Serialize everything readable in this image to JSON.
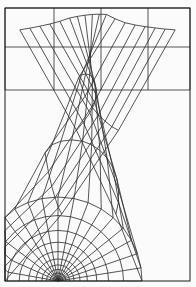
{
  "figure": {
    "type": "mesh-diagram",
    "width": 196,
    "height": 287,
    "background_color": "#fbfbfb",
    "line_color": "#2b2b2b",
    "frame_color": "#1a1a1a",
    "line_width": 0.8,
    "frame_width": 1.0
  },
  "mesh_data": {
    "domain_rect": {
      "x0": 5,
      "y0": 8,
      "x1": 190,
      "y1": 281
    },
    "singularity_point": {
      "x": 58,
      "y": 281
    },
    "description": "Rectangular domain meshed with a polar fan of quadrilaterals that converge geometrically onto a singular point on the bottom edge, blending upward into a structured 4x2 quadrilateral grid.",
    "structured_region": {
      "rows": 2,
      "columns": 4,
      "vertical_lines_x": [
        5,
        54,
        101,
        148,
        190
      ],
      "horizontal_lines_y": [
        8,
        47,
        90
      ]
    },
    "radial_region": {
      "ring_count": 14,
      "ray_count": 17,
      "ring_radii": [
        3.0,
        5.2,
        8.0,
        11.6,
        16.2,
        22.0,
        29.4,
        38.8,
        50.6,
        65.5,
        84.0,
        107.0,
        146.0,
        196.0
      ],
      "ray_angles_deg": [
        0,
        9,
        19,
        29,
        39,
        49,
        59,
        69,
        79,
        90,
        101,
        111,
        121,
        131,
        143,
        156,
        170,
        180
      ],
      "growth_ratio": 1.28,
      "blend_start_ring": 11,
      "note": "Rings are concentric circular arcs about the singular point; radii grow geometrically outward. Rays are straight spokes clipped to the rectangular boundary."
    },
    "legend": [],
    "annotations": []
  }
}
